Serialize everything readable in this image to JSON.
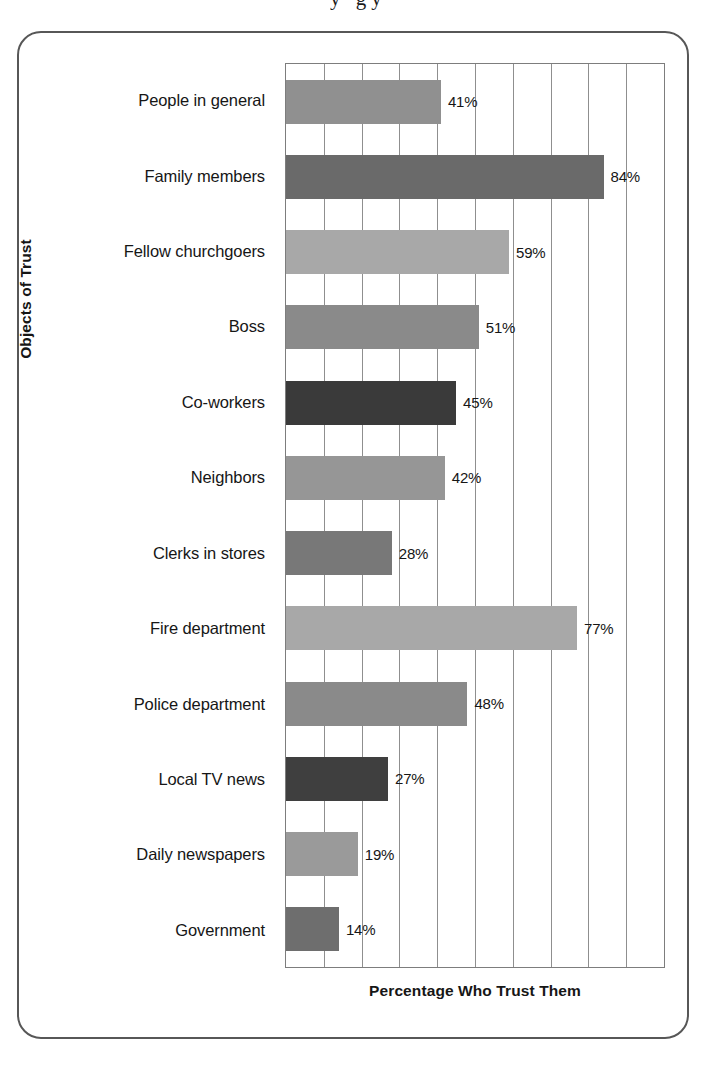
{
  "figure": {
    "page_bleed_text": "y     gy",
    "y_axis_title": "Objects of Trust",
    "x_axis_title": "Percentage Who Trust Them",
    "frame_color": "#575757",
    "axis_color": "#7d7d7d",
    "gridline_color": "#8f8f8f",
    "text_color": "#161616"
  },
  "chart_data": {
    "type": "bar",
    "orientation": "horizontal",
    "title": "",
    "xlabel": "Percentage Who Trust Them",
    "ylabel": "Objects of Trust",
    "xlim": [
      0,
      100
    ],
    "xtick_interval": 10,
    "xtick_labels_shown": false,
    "grid": true,
    "legend": "none",
    "value_label_suffix": "%",
    "categories": [
      "People in general",
      "Family members",
      "Fellow churchgoers",
      "Boss",
      "Co-workers",
      "Neighbors",
      "Clerks in stores",
      "Fire department",
      "Police department",
      "Local TV news",
      "Daily newspapers",
      "Government"
    ],
    "values": [
      41,
      84,
      59,
      51,
      45,
      42,
      28,
      77,
      48,
      27,
      19,
      14
    ],
    "value_labels": [
      "41%",
      "84%",
      "59%",
      "51%",
      "45%",
      "42%",
      "28%",
      "77%",
      "48%",
      "27%",
      "19%",
      "14%"
    ],
    "bar_colors": [
      "#909090",
      "#6a6a6a",
      "#a8a8a8",
      "#8a8a8a",
      "#3a3a3a",
      "#969696",
      "#787878",
      "#a8a8a8",
      "#8a8a8a",
      "#3f3f3f",
      "#9a9a9a",
      "#6e6e6e"
    ]
  }
}
